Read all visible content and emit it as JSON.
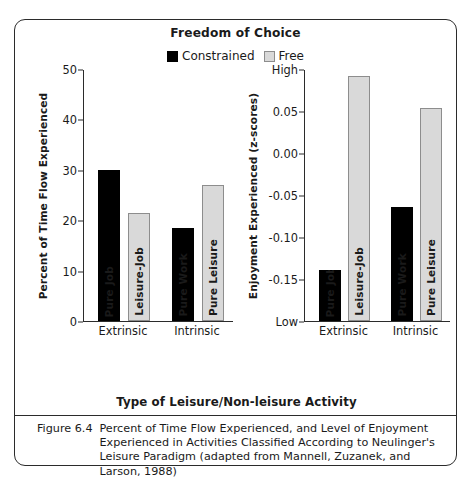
{
  "figure": {
    "title": "Freedom of Choice",
    "xaxis_title": "Type of Leisure/Non-leisure Activity",
    "caption_number": "Figure 6.4",
    "caption_text": "Percent of Time Flow Experienced, and Level of Enjoyment Experienced in Activities Classified According to Neulinger's Leisure Paradigm (adapted from Mannell, Zuzanek, and Larson, 1988)"
  },
  "legend": {
    "entries": [
      {
        "label": "Constrained",
        "color": "#000000",
        "key": "constrained"
      },
      {
        "label": "Free",
        "color": "#d9d9d9",
        "key": "free"
      }
    ]
  },
  "colors": {
    "constrained": "#000000",
    "free": "#d9d9d9",
    "free_outline": "#8d8d8d",
    "axis": "#2b2b2b",
    "frame": "#2b2b2b",
    "background": "#ffffff"
  },
  "chart_data": [
    {
      "type": "bar",
      "panel": "left",
      "title": "Freedom of Choice",
      "ylabel": "Percent of Time Flow Experienced",
      "xlabel": "Type of Leisure/Non-leisure Activity",
      "ylim": [
        0,
        50
      ],
      "yticks": [
        0,
        10,
        20,
        30,
        40,
        50
      ],
      "ytick_labels": [
        "0",
        "10",
        "20",
        "30",
        "40",
        "50"
      ],
      "grid": false,
      "legend_position": "top-center",
      "categories": [
        "Extrinsic",
        "Intrinsic"
      ],
      "bars": [
        {
          "group": "Extrinsic",
          "label": "Pure Job",
          "series": "Constrained",
          "value": 30.0
        },
        {
          "group": "Extrinsic",
          "label": "Leisure-Job",
          "series": "Free",
          "value": 21.5
        },
        {
          "group": "Intrinsic",
          "label": "Pure Work",
          "series": "Constrained",
          "value": 18.5
        },
        {
          "group": "Intrinsic",
          "label": "Pure Leisure",
          "series": "Free",
          "value": 27.0
        }
      ],
      "series": [
        {
          "name": "Constrained",
          "values": [
            30.0,
            18.5
          ]
        },
        {
          "name": "Free",
          "values": [
            21.5,
            27.0
          ]
        }
      ]
    },
    {
      "type": "bar",
      "panel": "right",
      "ylabel": "Enjoyment Experienced (z-scores)",
      "xlabel": "Type of Leisure/Non-leisure Activity",
      "ylim": [
        -0.2,
        0.1
      ],
      "yticks": [
        0.1,
        0.05,
        0.0,
        -0.05,
        -0.1,
        -0.15,
        -0.2
      ],
      "ytick_labels": [
        "High",
        "0.05",
        "0.00",
        "-0.05",
        "-0.10",
        "-0.15",
        "Low"
      ],
      "grid": false,
      "legend_position": "top-center",
      "categories": [
        "Extrinsic",
        "Intrinsic"
      ],
      "bars": [
        {
          "group": "Extrinsic",
          "label": "Pure Job",
          "series": "Constrained",
          "value": -0.139
        },
        {
          "group": "Extrinsic",
          "label": "Leisure-Job",
          "series": "Free",
          "value": 0.092
        },
        {
          "group": "Intrinsic",
          "label": "Pure Work",
          "series": "Constrained",
          "value": -0.064
        },
        {
          "group": "Intrinsic",
          "label": "Pure Leisure",
          "series": "Free",
          "value": 0.054
        }
      ],
      "series": [
        {
          "name": "Constrained",
          "values": [
            -0.139,
            -0.064
          ]
        },
        {
          "name": "Free",
          "values": [
            0.092,
            0.054
          ]
        }
      ]
    }
  ]
}
